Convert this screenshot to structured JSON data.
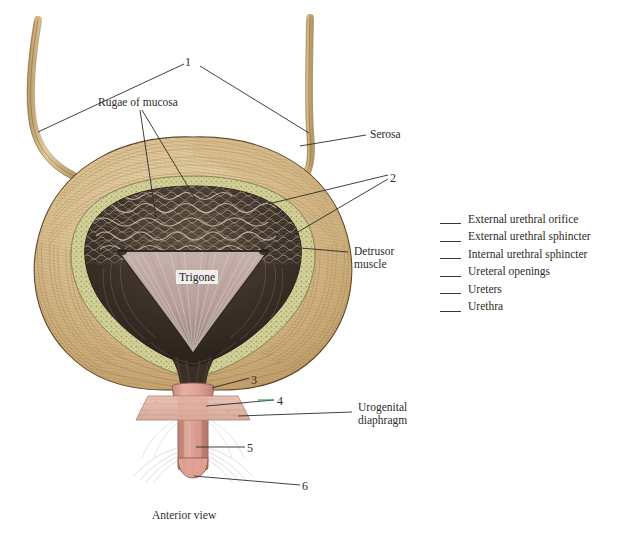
{
  "figure": {
    "caption": "Anterior view"
  },
  "callout_numbers": [
    {
      "id": "1",
      "value": "1",
      "x": 187,
      "y": 62
    },
    {
      "id": "2",
      "value": "2",
      "x": 392,
      "y": 171
    },
    {
      "id": "3",
      "value": "3",
      "x": 253,
      "y": 374
    },
    {
      "id": "4",
      "value": "4",
      "x": 279,
      "y": 396
    },
    {
      "id": "5",
      "value": "5",
      "x": 249,
      "y": 443
    },
    {
      "id": "6",
      "value": "6",
      "x": 304,
      "y": 481
    }
  ],
  "text_labels": {
    "rugae": "Rugae of mucosa",
    "serosa": "Serosa",
    "detrusor_line1": "Detrusor",
    "detrusor_line2": "muscle",
    "trigone": "Trigone",
    "urogenital_line1": "Urogenital",
    "urogenital_line2": "diaphragm"
  },
  "legend": {
    "items": [
      {
        "label": "External urethral orifice"
      },
      {
        "label": "External urethral sphincter"
      },
      {
        "label": "Internal urethral sphincter"
      },
      {
        "label": "Ureteral openings"
      },
      {
        "label": "Ureters"
      },
      {
        "label": "Urethra"
      }
    ]
  },
  "colors": {
    "background": "#ffffff",
    "detrusor_tan": "#d8bd8e",
    "detrusor_light": "#e6d2ab",
    "detrusor_shadow": "#b99a68",
    "submucosa_olive": "#cdc98a",
    "mucosa_dark": "#3b3028",
    "trigone_pink": "#c9b2ad",
    "urethra_pink": "#dda396",
    "ureter_tan": "#d9bd91",
    "leader_line": "#2b2b2b",
    "accent_green": "#1f9a4a",
    "text": "#2e2b28"
  }
}
